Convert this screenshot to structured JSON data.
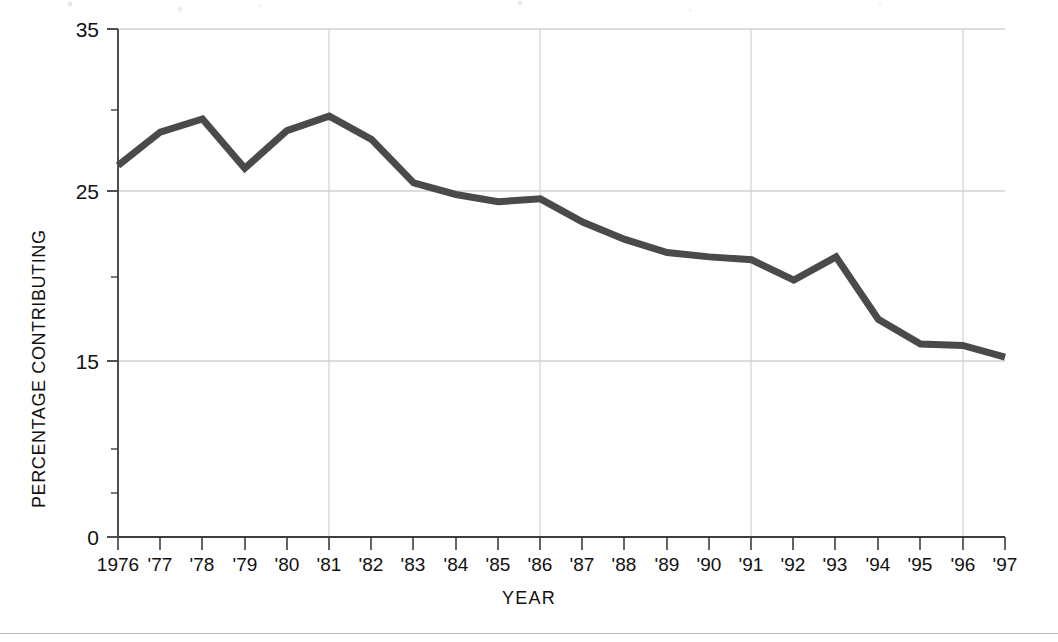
{
  "figure": {
    "background_color": "#ffffff",
    "line_color": "#4a4a4a",
    "axis_color": "#3d3d3d",
    "grid_color": "#cfcfcf",
    "rule_color": "#b9b9b9"
  },
  "axis_titles": {
    "y": "PERCENTAGE CONTRIBUTING",
    "x": "YEAR"
  },
  "chart_data": {
    "type": "line",
    "title": "",
    "subtitle": "",
    "xlabel": "YEAR",
    "ylabel": "PERCENTAGE CONTRIBUTING",
    "categories": [
      "1976",
      "'77",
      "'78",
      "'79",
      "'80",
      "'81",
      "'82",
      "'83",
      "'84",
      "'85",
      "'86",
      "'87",
      "'88",
      "'89",
      "'90",
      "'91",
      "'92",
      "'93",
      "'94",
      "'95",
      "'96",
      "'97"
    ],
    "x": [
      1976,
      1977,
      1978,
      1979,
      1980,
      1981,
      1982,
      1983,
      1984,
      1985,
      1986,
      1987,
      1988,
      1989,
      1990,
      1991,
      1992,
      1993,
      1994,
      1995,
      1996,
      1997
    ],
    "values": [
      25.6,
      27.9,
      28.8,
      25.4,
      28.0,
      29.0,
      27.4,
      24.4,
      23.6,
      23.1,
      23.3,
      21.7,
      20.5,
      19.6,
      19.3,
      19.1,
      17.7,
      19.3,
      15.0,
      13.3,
      13.2,
      12.4
    ],
    "series": [
      {
        "name": "Percentage contributing",
        "values": [
          25.6,
          27.9,
          28.8,
          25.4,
          28.0,
          29.0,
          27.4,
          24.4,
          23.6,
          23.1,
          23.3,
          21.7,
          20.5,
          19.6,
          19.3,
          19.1,
          17.7,
          19.3,
          15.0,
          13.3,
          13.2,
          12.4
        ]
      }
    ],
    "ylim": [
      0,
      35
    ],
    "xlim": [
      1976,
      1997
    ],
    "ytick_labels": [
      "0",
      "15",
      "25",
      "35"
    ],
    "ytick_values": [
      0,
      15,
      25,
      35
    ],
    "yminor_tick_values": [
      5,
      10,
      20,
      30
    ],
    "gridlines": {
      "horizontal_at": [
        15,
        25,
        35
      ],
      "vertical_at": [
        1976,
        1981,
        1986,
        1991,
        1996
      ]
    },
    "legend": null,
    "legend_position": "none",
    "grid": true,
    "markers": false
  }
}
